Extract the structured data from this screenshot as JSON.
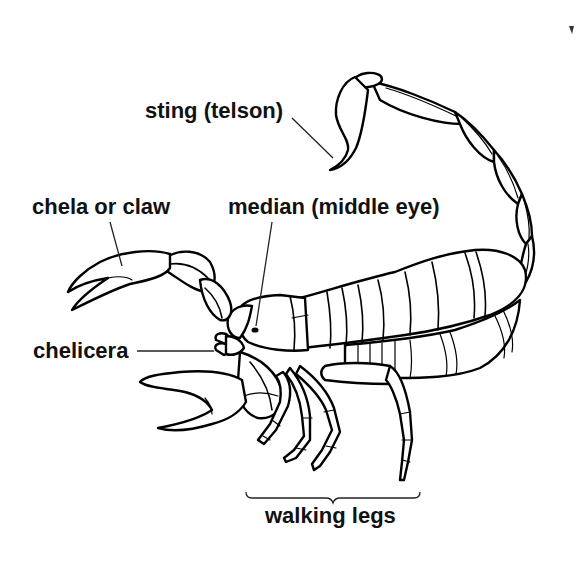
{
  "diagram": {
    "labels": {
      "sting": "sting (telson)",
      "chela": "chela or claw",
      "median_eye": "median (middle eye)",
      "chelicera": "chelicera",
      "walking_legs": "walking legs"
    },
    "colors": {
      "background": "#ffffff",
      "line": "#000000",
      "text": "#111111"
    }
  }
}
